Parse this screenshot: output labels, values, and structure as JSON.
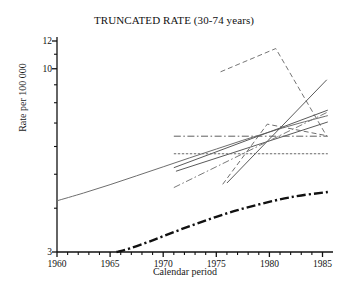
{
  "chart_data": {
    "type": "line",
    "title": "TRUNCATED RATE (30-74 years)",
    "xlabel": "Calendar period",
    "ylabel": "Rate per 100 000",
    "xlim": [
      1960,
      1985.8
    ],
    "ylim": [
      3,
      12
    ],
    "yscale": "log",
    "grid": false,
    "legend": "none",
    "xticks_major": [
      1960,
      1965,
      1970,
      1975,
      1980,
      1985
    ],
    "xtick_labels": [
      "1960",
      "1965",
      "1970",
      "1975",
      "1980",
      "1985"
    ],
    "xticks_minor_step": 1,
    "yticks_labeled": [
      3,
      10,
      12
    ],
    "ytick_labels": [
      "3",
      "10",
      "12"
    ],
    "yticks_minor": [
      4,
      5,
      6,
      7,
      8,
      9,
      11
    ],
    "series": [
      {
        "name": "long-trend-smooth-curve",
        "style": "solid",
        "color": "#6e6e6e",
        "width": 1.0,
        "x": [
          1960,
          1962.5,
          1965,
          1967.5,
          1970,
          1972.5,
          1975,
          1977.5,
          1980,
          1982.5,
          1985.5
        ],
        "values": [
          4.2,
          4.42,
          4.67,
          4.95,
          5.25,
          5.57,
          5.9,
          6.25,
          6.6,
          6.95,
          7.35
        ]
      },
      {
        "name": "lower-thick-dashdot-curve",
        "style": "dashdot",
        "color": "#111111",
        "width": 2.4,
        "x": [
          1965.6,
          1967,
          1969,
          1971,
          1973,
          1975,
          1977,
          1979,
          1981,
          1983,
          1985.5
        ],
        "values": [
          3.0,
          3.08,
          3.24,
          3.42,
          3.6,
          3.78,
          3.95,
          4.1,
          4.24,
          4.35,
          4.45
        ]
      },
      {
        "name": "peaked-dashed-line",
        "style": "dashed",
        "color": "#757575",
        "width": 1.0,
        "x": [
          1975.4,
          1980.6,
          1985.4
        ],
        "values": [
          9.8,
          11.42,
          6.42
        ]
      },
      {
        "name": "steep-rising-solid-line",
        "style": "solid",
        "color": "#5a5a5a",
        "width": 1.0,
        "x": [
          1976.0,
          1985.4
        ],
        "values": [
          4.72,
          9.3
        ]
      },
      {
        "name": "medium-rising-solid-line",
        "style": "solid",
        "color": "#5a5a5a",
        "width": 1.0,
        "x": [
          1971.0,
          1985.5
        ],
        "values": [
          5.22,
          7.62
        ]
      },
      {
        "name": "shallow-rising-solid-line",
        "style": "solid",
        "color": "#5a5a5a",
        "width": 1.0,
        "x": [
          1971.2,
          1985.5
        ],
        "values": [
          5.1,
          7.05
        ]
      },
      {
        "name": "rising-dashdot-line",
        "style": "dashdot",
        "color": "#7a7a7a",
        "width": 1.0,
        "x": [
          1971.0,
          1985.4
        ],
        "values": [
          4.58,
          7.5
        ]
      },
      {
        "name": "short-steep-dashed-line",
        "style": "dashed",
        "color": "#6e6e6e",
        "width": 1.0,
        "x": [
          1975.6,
          1979.8,
          1985.3
        ],
        "values": [
          4.68,
          6.95,
          6.45
        ]
      },
      {
        "name": "horizontal-dashdot-line",
        "style": "dashdot",
        "color": "#5f5f5f",
        "width": 1.0,
        "x": [
          1971.0,
          1985.5
        ],
        "values": [
          6.42,
          6.42
        ]
      },
      {
        "name": "horizontal-dense-dashed-line",
        "style": "densedash",
        "color": "#6a6a6a",
        "width": 1.2,
        "x": [
          1971.0,
          1985.5
        ],
        "values": [
          5.72,
          5.72
        ]
      }
    ]
  },
  "figure": {
    "title": "TRUNCATED RATE (30-74 years)",
    "xlabel": "Calendar period",
    "ylabel": "Rate per 100 000"
  }
}
